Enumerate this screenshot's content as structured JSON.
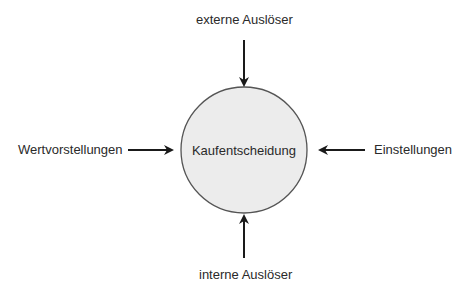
{
  "diagram": {
    "center": {
      "label": "Kaufentscheidung",
      "fill": "#ececec",
      "stroke": "#555555"
    },
    "inputs": {
      "top": "externe Auslöser",
      "bottom": "interne Auslöser",
      "left": "Wertvorstellungen",
      "right": "Einstellungen"
    }
  }
}
